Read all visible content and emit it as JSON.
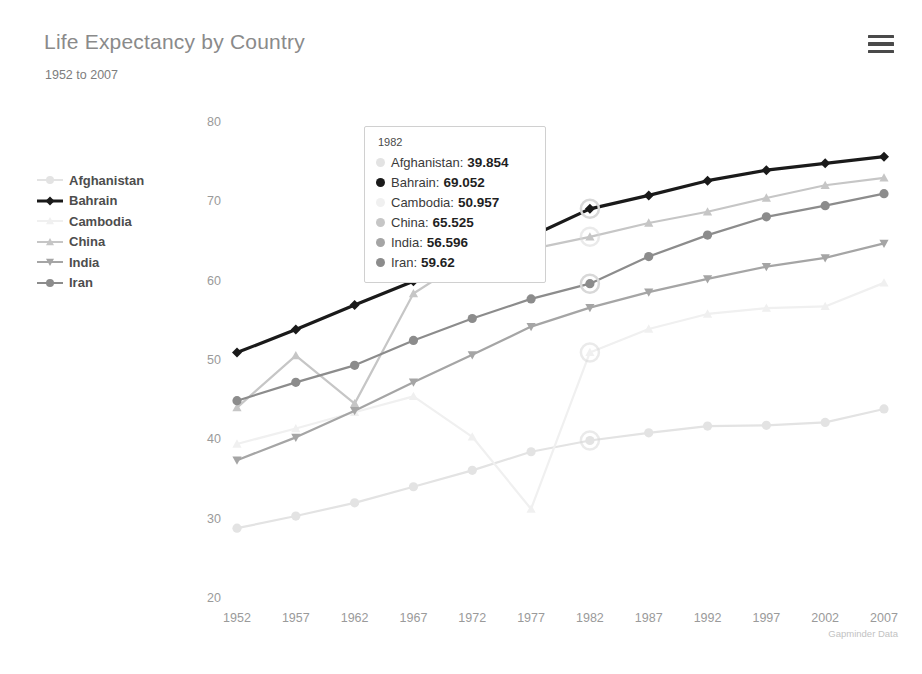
{
  "header": {
    "title": "Life Expectancy by Country",
    "subtitle": "1952 to 2007",
    "menu_icon": "hamburger-menu-icon"
  },
  "credit": "Gapminder Data",
  "colors": {
    "afghanistan": "#e3e3e3",
    "bahrain": "#1a1a1a",
    "cambodia": "#f0f0f0",
    "china": "#c6c6c6",
    "india": "#a5a5a5",
    "iran": "#8c8c8c",
    "axis_text": "#9a9a9a",
    "title_text": "#8a8a8a",
    "legend_text": "#4d4d4d",
    "tooltip_border": "#d0d0d0",
    "tooltip_bg": "#ffffff",
    "highlight_ring": "#d8d8d8"
  },
  "legend": {
    "items": [
      {
        "label": "Afghanistan",
        "color": "#e3e3e3",
        "marker": "circle"
      },
      {
        "label": "Bahrain",
        "color": "#1a1a1a",
        "marker": "diamond"
      },
      {
        "label": "Cambodia",
        "color": "#f0f0f0",
        "marker": "triangle-up"
      },
      {
        "label": "China",
        "color": "#c6c6c6",
        "marker": "triangle-up"
      },
      {
        "label": "India",
        "color": "#a5a5a5",
        "marker": "triangle-down"
      },
      {
        "label": "Iran",
        "color": "#8c8c8c",
        "marker": "circle"
      }
    ]
  },
  "tooltip": {
    "year": "1982",
    "rows": [
      {
        "name": "Afghanistan:",
        "value": "39.854",
        "color": "#e3e3e3"
      },
      {
        "name": "Bahrain:",
        "value": "69.052",
        "color": "#1a1a1a"
      },
      {
        "name": "Cambodia:",
        "value": "50.957",
        "color": "#f0f0f0"
      },
      {
        "name": "China:",
        "value": "65.525",
        "color": "#c6c6c6"
      },
      {
        "name": "India:",
        "value": "56.596",
        "color": "#a5a5a5"
      },
      {
        "name": "Iran:",
        "value": "59.62",
        "color": "#8c8c8c"
      }
    ]
  },
  "chart_data": {
    "type": "line",
    "title": "Life Expectancy by Country",
    "subtitle": "1952 to 2007",
    "xlabel": "",
    "ylabel": "",
    "ylim": [
      20,
      80
    ],
    "ytick_step": 10,
    "yticks": [
      20,
      30,
      40,
      50,
      60,
      70,
      80
    ],
    "grid": false,
    "legend_position": "left",
    "annotation": "Gapminder Data",
    "highlight_year": 1982,
    "categories": [
      1952,
      1957,
      1962,
      1967,
      1972,
      1977,
      1982,
      1987,
      1992,
      1997,
      2002,
      2007
    ],
    "series": [
      {
        "name": "Afghanistan",
        "color": "#e3e3e3",
        "marker": "circle",
        "values": [
          28.801,
          30.332,
          31.997,
          34.02,
          36.088,
          38.438,
          39.854,
          40.822,
          41.674,
          41.763,
          42.129,
          43.828
        ]
      },
      {
        "name": "Bahrain",
        "color": "#1a1a1a",
        "marker": "diamond",
        "values": [
          50.939,
          53.832,
          56.923,
          59.923,
          63.3,
          65.593,
          69.052,
          70.75,
          72.601,
          73.925,
          74.795,
          75.635
        ]
      },
      {
        "name": "Cambodia",
        "color": "#f0f0f0",
        "marker": "triangle-up",
        "values": [
          39.417,
          41.366,
          43.415,
          45.415,
          40.317,
          31.22,
          50.957,
          53.914,
          55.803,
          56.534,
          56.752,
          59.723
        ]
      },
      {
        "name": "China",
        "color": "#c6c6c6",
        "marker": "triangle-up",
        "values": [
          44.0,
          50.549,
          44.501,
          58.381,
          63.119,
          63.967,
          65.525,
          67.274,
          68.69,
          70.426,
          72.028,
          72.961
        ]
      },
      {
        "name": "India",
        "color": "#a5a5a5",
        "marker": "triangle-down",
        "values": [
          37.373,
          40.249,
          43.605,
          47.193,
          50.651,
          54.208,
          56.596,
          58.553,
          60.223,
          61.765,
          62.879,
          64.698
        ]
      },
      {
        "name": "Iran",
        "color": "#8c8c8c",
        "marker": "circle",
        "values": [
          44.869,
          47.181,
          49.325,
          52.469,
          55.234,
          57.702,
          59.62,
          63.04,
          65.742,
          68.042,
          69.451,
          70.964
        ]
      }
    ]
  }
}
